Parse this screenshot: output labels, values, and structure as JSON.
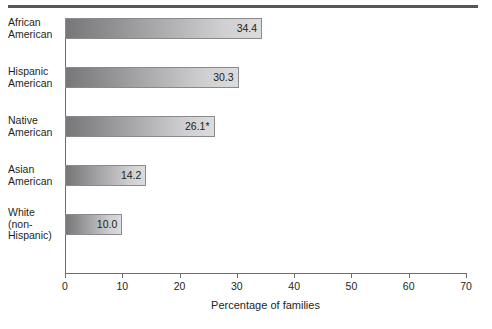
{
  "chart_data": {
    "type": "bar",
    "orientation": "horizontal",
    "title": "",
    "xlabel": "Percentage of families",
    "ylabel": "",
    "xlim": [
      0,
      70
    ],
    "xticks": [
      0,
      10,
      20,
      30,
      40,
      50,
      60,
      70
    ],
    "grid": false,
    "legend": null,
    "categories": [
      "African American",
      "Hispanic American",
      "Native American",
      "Asian American",
      "White (non-Hispanic)"
    ],
    "category_lines": [
      [
        "African",
        "American"
      ],
      [
        "Hispanic",
        "American"
      ],
      [
        "Native",
        "American"
      ],
      [
        "Asian",
        "American"
      ],
      [
        "White",
        "(non-",
        "Hispanic)"
      ]
    ],
    "values": [
      34.4,
      30.3,
      26.1,
      14.2,
      10.0
    ],
    "value_labels": [
      "34.4",
      "30.3",
      "26.1*",
      "14.2",
      "10.0"
    ],
    "annotations": [
      "* value carries footnote asterisk"
    ]
  },
  "axis": {
    "x_title": "Percentage of families",
    "tick_labels": [
      "0",
      "10",
      "20",
      "30",
      "40",
      "50",
      "60",
      "70"
    ]
  },
  "colors": {
    "rule": "#55565a",
    "axis": "#6d6e71",
    "bar_dark": "#77777a",
    "bar_light": "#dcdcde",
    "bar_border": "#8a8a8d",
    "text": "#231f20",
    "background": "#ffffff"
  },
  "caption_remnant": ""
}
